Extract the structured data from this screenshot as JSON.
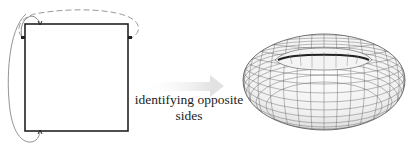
{
  "diagram": {
    "left_figure": "square-with-identified-edges",
    "right_figure": "torus",
    "caption_line1": "identifying opposite",
    "caption_line2": "sides",
    "colors": {
      "square_stroke": "#222222",
      "dashed_curve": "#9a9a9a",
      "solid_curve": "#666666",
      "arrow": "#e8e8e8",
      "torus_mesh": "#555555"
    }
  }
}
